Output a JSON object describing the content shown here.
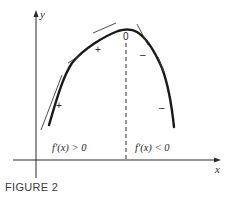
{
  "figure": {
    "caption": "FIGURE 2",
    "axes": {
      "x_label": "x",
      "y_label": "y"
    },
    "critical_point_label": "0",
    "regions": {
      "left_condition": "f′(x) > 0",
      "right_condition": "f′(x) < 0"
    },
    "slope_signs": {
      "left_upper": "+",
      "left_lower": "+",
      "right_upper": "–",
      "right_lower": "–"
    },
    "colors": {
      "curve": "#1a1a1a",
      "axes": "#2a2a2a",
      "tangent": "#3a3a3a",
      "background": "#ffffff"
    }
  }
}
